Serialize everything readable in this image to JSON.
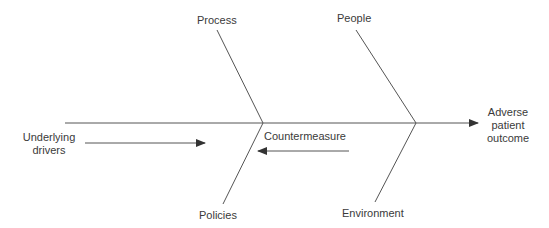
{
  "diagram": {
    "type": "fishbone",
    "effect": "Adverse patient outcome",
    "effect_lines": [
      "Adverse",
      "patient",
      "outcome"
    ],
    "causes": {
      "top": [
        "Process",
        "People"
      ],
      "bottom": [
        "Policies",
        "Environment"
      ]
    },
    "arrows": {
      "left_to_right": "Underlying drivers",
      "left_to_right_lines": [
        "Underlying",
        "drivers"
      ],
      "right_to_left": "Countermeasure"
    },
    "line_color": "#555555"
  }
}
